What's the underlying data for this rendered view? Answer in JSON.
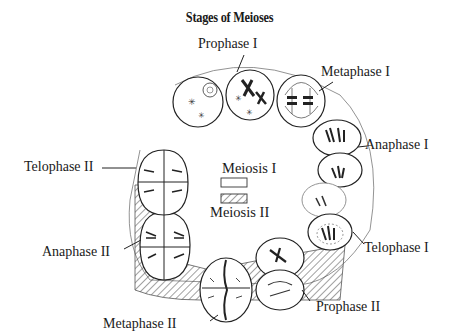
{
  "title": "Stages of Meioses",
  "legend": {
    "meiosis1": "Meiosis I",
    "meiosis2": "Meiosis II"
  },
  "stages": [
    {
      "id": "prophase-1",
      "label": "Prophase I"
    },
    {
      "id": "metaphase-1",
      "label": "Metaphase I"
    },
    {
      "id": "anaphase-1",
      "label": "Anaphase I"
    },
    {
      "id": "telophase-1",
      "label": "Telophase I"
    },
    {
      "id": "prophase-2",
      "label": "Prophase II"
    },
    {
      "id": "metaphase-2",
      "label": "Metaphase II"
    },
    {
      "id": "anaphase-2",
      "label": "Anaphase II"
    },
    {
      "id": "telophase-2",
      "label": "Telophase II"
    }
  ]
}
